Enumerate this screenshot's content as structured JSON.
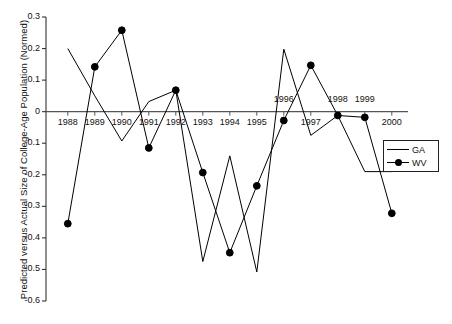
{
  "chart_data": {
    "type": "line",
    "title": "",
    "xlabel": "",
    "ylabel": "Predicted versus Actual Size of College-Age Population (Normed)",
    "categories": [
      "1988",
      "1989",
      "1990",
      "1991",
      "1992",
      "1993",
      "1994",
      "1995",
      "1996",
      "1997",
      "1998",
      "1999",
      "2000"
    ],
    "x": [
      1988,
      1989,
      1990,
      1991,
      1992,
      1993,
      1994,
      1995,
      1996,
      1997,
      1998,
      1999,
      2000
    ],
    "xlim": [
      1987.6,
      2000.6
    ],
    "ylim": [
      -0.6,
      0.3
    ],
    "yticks": [
      0.3,
      0.2,
      0.1,
      0.0,
      -0.1,
      -0.2,
      -0.3,
      -0.4,
      -0.5,
      -0.6
    ],
    "ytick_labels": [
      "0.3",
      "0.2",
      "0.1",
      "0",
      "-0.1",
      "-0.2",
      "-0.3",
      "-0.4",
      "-0.5",
      "-0.6"
    ],
    "grid": false,
    "legend_position": "right-middle",
    "zero_line": true,
    "series": [
      {
        "name": "GA",
        "marker": "none",
        "color": "#000000",
        "values": [
          0.2,
          0.05,
          -0.093,
          0.032,
          0.068,
          -0.475,
          -0.14,
          -0.508,
          0.198,
          -0.075,
          -0.012,
          -0.19,
          -0.19
        ]
      },
      {
        "name": "WV",
        "marker": "filled-circle",
        "color": "#000000",
        "values": [
          -0.355,
          0.142,
          0.258,
          -0.115,
          0.068,
          -0.193,
          -0.447,
          -0.235,
          -0.028,
          0.147,
          -0.012,
          -0.018,
          -0.322
        ]
      }
    ],
    "xtick_label_placement": {
      "1988": "below",
      "1989": "below",
      "1990": "below",
      "1991": "below",
      "1992": "below",
      "1993": "below",
      "1994": "below",
      "1995": "below",
      "1996": "above",
      "1997": "below",
      "1998": "above",
      "1999": "above",
      "2000": "below"
    }
  },
  "legend": {
    "entries": [
      {
        "label": "GA"
      },
      {
        "label": "WV"
      }
    ]
  },
  "axis": {
    "y_title": "Predicted versus Actual Size of College-Age Population (Normed)"
  }
}
